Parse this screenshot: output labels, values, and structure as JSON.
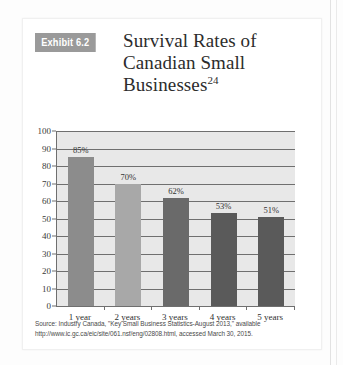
{
  "exhibit": {
    "badge": "Exhibit 6.2",
    "title_lines": [
      "Survival Rates of",
      "Canadian Small",
      "Businesses"
    ],
    "title_superscript": "24"
  },
  "source": {
    "text": "Source: Industry Canada, \"Key Small Business Statistics-August 2013,\" available http://www.ic.gc.ca/eic/site/061.nsf/eng/02808.html, accessed March 30, 2015."
  },
  "colors": {
    "badge_bg": "#9a9a9a",
    "plot_bg": "#e8e8e8",
    "axis": "#6f6f6f",
    "bar_1": "#8c8c8c",
    "bar_2": "#a8a8a8",
    "bar_3": "#6a6a6a",
    "bar_4": "#5a5a5a",
    "bar_5": "#5a5a5a"
  },
  "chart_data": {
    "type": "bar",
    "title": "Survival Rates of Canadian Small Businesses",
    "xlabel": "",
    "ylabel": "",
    "categories": [
      "1 year",
      "2 years",
      "3 years",
      "4 years",
      "5 years"
    ],
    "values": [
      85,
      70,
      62,
      53,
      51
    ],
    "data_labels": [
      "85%",
      "70%",
      "62%",
      "53%",
      "51%"
    ],
    "ylim": [
      0,
      100
    ],
    "yticks": [
      100,
      90,
      80,
      70,
      60,
      50,
      40,
      30,
      20,
      10,
      0
    ],
    "ytick_labels": [
      "100",
      "90",
      "80",
      "70",
      "60",
      "50",
      "40",
      "30",
      "20",
      "10",
      "0"
    ],
    "grid": true,
    "legend": false,
    "bar_colors": [
      "#8c8c8c",
      "#a8a8a8",
      "#6a6a6a",
      "#5a5a5a",
      "#5a5a5a"
    ]
  }
}
